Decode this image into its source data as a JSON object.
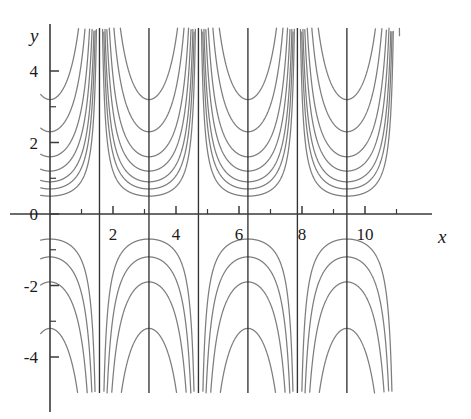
{
  "figure": {
    "background_color": "#ffffff",
    "axis_color": "#3a3a3a",
    "curve_color": "#7d7d7d",
    "asymptote_color": "#333333",
    "label_color": "#1a1a1a"
  },
  "labels": {
    "x_axis": "x",
    "y_axis": "y"
  },
  "chart_data": {
    "type": "line",
    "title": "",
    "xlabel": "x",
    "ylabel": "y",
    "grid": false,
    "legend": null,
    "xlim": [
      -0.3,
      11.1
    ],
    "ylim": [
      -4.9,
      5.0
    ],
    "x_major_ticks": [
      2,
      4,
      6,
      8,
      10
    ],
    "x_major_tick_labels": [
      "2",
      "4",
      "6",
      "8",
      "10"
    ],
    "x_minor_ticks": [
      1,
      3,
      5,
      7,
      9,
      11
    ],
    "y_major_ticks": [
      -4,
      -2,
      0,
      2,
      4
    ],
    "y_major_tick_labels": [
      "-4",
      "-2",
      "0",
      "2",
      "4"
    ],
    "y_minor_ticks": [
      -3,
      -1,
      1,
      3
    ],
    "asymptotes": [
      1.5708,
      3.1416,
      4.7124,
      6.2832,
      7.854,
      9.4248
    ],
    "series": [
      {
        "name": "c = 0.50",
        "c": 0.5,
        "half": "upper"
      },
      {
        "name": "c = 0.70",
        "c": 0.7,
        "half": "upper"
      },
      {
        "name": "c = 0.90",
        "c": 0.9,
        "half": "upper"
      },
      {
        "name": "c = 1.20",
        "c": 1.2,
        "half": "upper"
      },
      {
        "name": "c = 1.60",
        "c": 1.6,
        "half": "upper"
      },
      {
        "name": "c = 2.30",
        "c": 2.3,
        "half": "upper"
      },
      {
        "name": "c = 3.20",
        "c": 3.2,
        "half": "upper"
      },
      {
        "name": "c = -0.70",
        "c": 0.7,
        "half": "lower"
      },
      {
        "name": "c = -1.20",
        "c": 1.2,
        "half": "lower"
      },
      {
        "name": "c = -1.90",
        "c": 1.9,
        "half": "lower"
      },
      {
        "name": "c = -3.20",
        "c": 3.2,
        "half": "lower"
      }
    ]
  }
}
